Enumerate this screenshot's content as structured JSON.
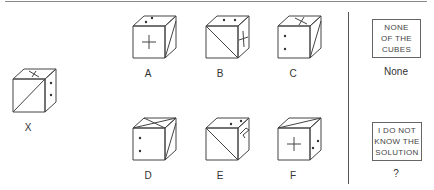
{
  "question_cube": {
    "label": "X"
  },
  "options": [
    {
      "id": "A",
      "label": "A"
    },
    {
      "id": "B",
      "label": "B"
    },
    {
      "id": "C",
      "label": "C"
    },
    {
      "id": "D",
      "label": "D"
    },
    {
      "id": "E",
      "label": "E"
    },
    {
      "id": "F",
      "label": "F"
    }
  ],
  "answers": {
    "none": {
      "lines": [
        "NONE",
        "OF THE",
        "CUBES"
      ],
      "caption": "None"
    },
    "unknown": {
      "lines": [
        "I DO NOT",
        "KNOW THE",
        "SOLUTION"
      ],
      "caption": "?"
    }
  }
}
